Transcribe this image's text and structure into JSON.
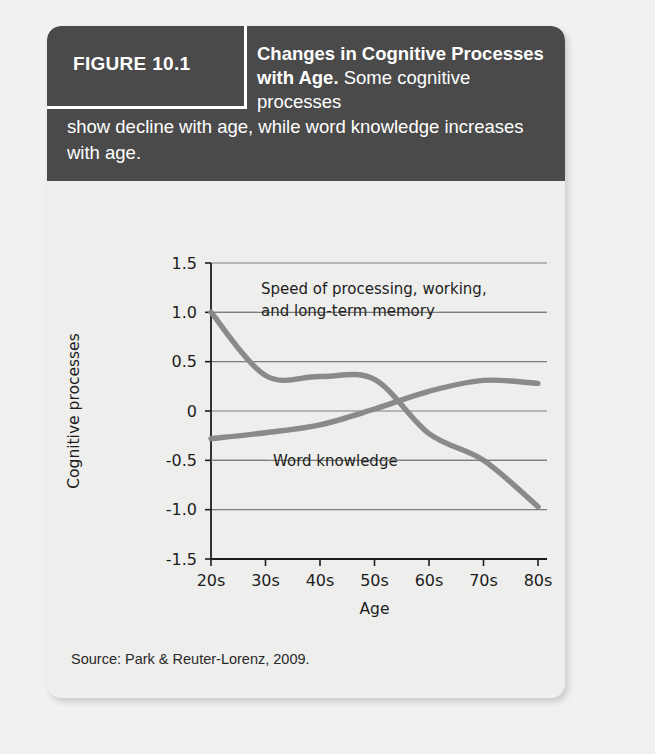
{
  "figure": {
    "number_label": "FIGURE 10.1",
    "caption_bold": "Changes in Cognitive Processes with Age.",
    "caption_rest_1": "Some cognitive processes",
    "caption_rest_2": "show decline with age, while word knowledge increases with age.",
    "source": "Source: Park & Reuter-Lorenz, 2009."
  },
  "colors": {
    "header_background": "#4a4a4a",
    "card_background": "#eeeeec",
    "page_background": "#f1f1ef",
    "curve": "#8a8a8a",
    "gridline": "#7d7d7d",
    "axis": "#1d1d1d",
    "text": "#1d1d1d"
  },
  "chart_data": {
    "type": "line",
    "title": "",
    "xlabel": "Age",
    "ylabel": "Cognitive processes",
    "grid": true,
    "legend": "annotation-labels",
    "categories": [
      "20s",
      "30s",
      "40s",
      "50s",
      "60s",
      "70s",
      "80s"
    ],
    "x": [
      20,
      30,
      40,
      50,
      60,
      70,
      80
    ],
    "xlim": [
      20,
      80
    ],
    "ylim": [
      -1.5,
      1.5
    ],
    "yticks": [
      "1.5",
      "1.0",
      "0.5",
      "0",
      "-0.5",
      "-1.0",
      "-1.5"
    ],
    "ytick_values": [
      1.5,
      1.0,
      0.5,
      0,
      -0.5,
      -1.0,
      -1.5
    ],
    "series": [
      {
        "name": "Speed of processing, working, and long-term memory",
        "label_line_1": "Speed of processing, working,",
        "label_line_2": "and long-term memory",
        "values": [
          1.0,
          0.36,
          0.35,
          0.32,
          -0.23,
          -0.5,
          -0.97
        ]
      },
      {
        "name": "Word knowledge",
        "label_line_1": "Word knowledge",
        "label_line_2": "",
        "values": [
          -0.28,
          -0.22,
          -0.14,
          0.02,
          0.2,
          0.31,
          0.28
        ]
      }
    ],
    "annotations": [
      {
        "text": "Speed of processing, working, and long-term memory",
        "at_value": 1.0,
        "has_leader_lines": true
      },
      {
        "text": "Word knowledge",
        "at_value": -0.5,
        "has_leader_lines": true
      }
    ]
  }
}
